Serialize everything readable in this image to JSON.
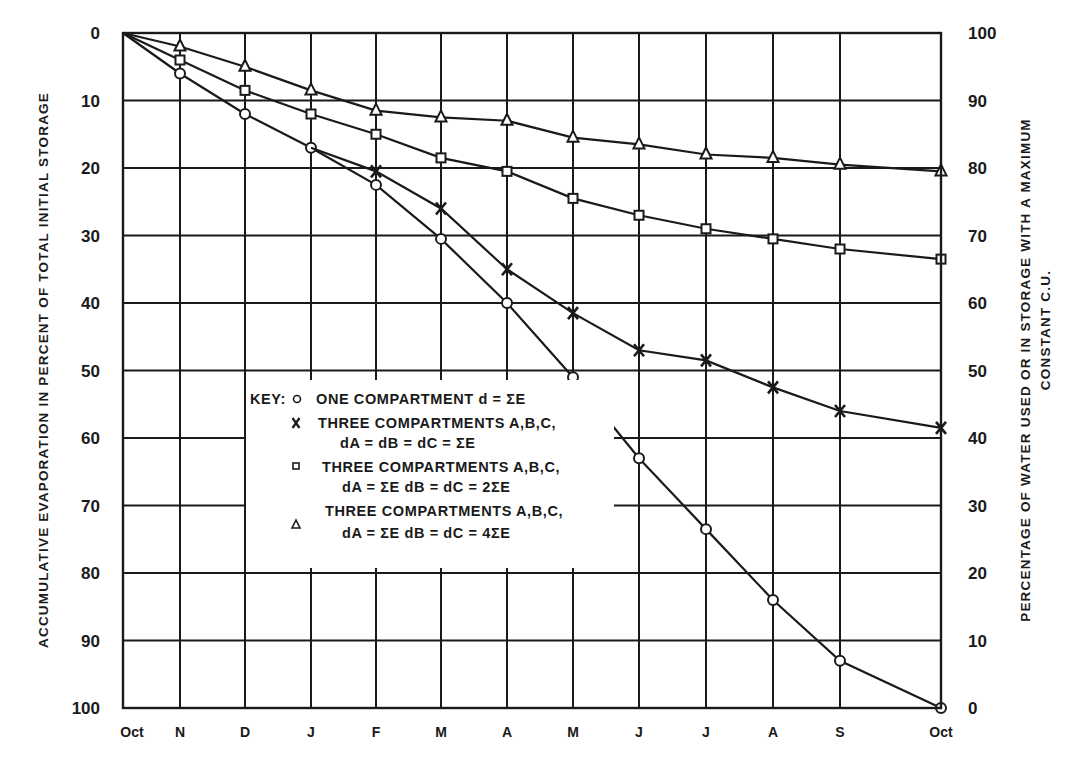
{
  "chart_data": {
    "type": "line",
    "title": "",
    "x": [
      "Oct",
      "N",
      "D",
      "J",
      "F",
      "M",
      "A",
      "M",
      "J",
      "J",
      "A",
      "S",
      "Oct"
    ],
    "xlabel": "",
    "ylabel": "ACCUMULATIVE EVAPORATION IN PERCENT OF TOTAL INITIAL STORAGE",
    "ylabel_right_line1": "PERCENTAGE OF WATER USED OR IN STORAGE WITH A MAXIMUM",
    "ylabel_right_line2": "CONSTANT C.U.",
    "ylim": [
      0,
      100
    ],
    "y_inverted": true,
    "y_ticks_left": [
      "0",
      "10",
      "20",
      "30",
      "40",
      "50",
      "60",
      "70",
      "80",
      "90",
      "100"
    ],
    "y_ticks_right": [
      "100",
      "90",
      "80",
      "70",
      "60",
      "50",
      "40",
      "30",
      "20",
      "10",
      "0"
    ],
    "grid": true,
    "legend_position": "inside-lower-left",
    "legend": {
      "key_label": "KEY:",
      "entries": [
        {
          "marker": "circle",
          "line1": "ONE COMPARTMENT d = ΣE",
          "line2": ""
        },
        {
          "marker": "x",
          "line1": "THREE COMPARTMENTS A,B,C,",
          "line2": "dA = dB = dC = ΣE"
        },
        {
          "marker": "square",
          "line1": "THREE COMPARTMENTS A,B,C,",
          "line2": "dA = ΣE   dB = dC = 2ΣE"
        },
        {
          "marker": "triangle",
          "line1": "THREE COMPARTMENTS A,B,C,",
          "line2": "dA = ΣE   dB = dC = 4ΣE"
        }
      ]
    },
    "series": [
      {
        "name": "One compartment d = ΣE",
        "marker": "circle",
        "values": [
          0,
          6,
          12,
          17,
          22.5,
          30.5,
          40,
          51,
          63,
          73.5,
          84,
          93,
          100
        ]
      },
      {
        "name": "Three compartments A,B,C, dA = dB = dC = ΣE",
        "marker": "x",
        "values": [
          0,
          null,
          null,
          null,
          20.5,
          26,
          35,
          41.5,
          47,
          48.5,
          52.5,
          56,
          58.5
        ]
      },
      {
        "name": "Three compartments A,B,C, dA = ΣE, dB = dC = 2ΣE",
        "marker": "square",
        "values": [
          0,
          4,
          8.5,
          12,
          15,
          18.5,
          20.5,
          24.5,
          27,
          29,
          30.5,
          32,
          33.5
        ]
      },
      {
        "name": "Three compartments A,B,C, dA = ΣE, dB = dC = 4ΣE",
        "marker": "triangle",
        "values": [
          0,
          2,
          5,
          8.5,
          11.5,
          12.5,
          13,
          15.5,
          16.5,
          18,
          18.5,
          19.5,
          20.5
        ]
      }
    ],
    "x_line_connect_note": "X series branches off the circle series between J and F"
  },
  "layout": {
    "plot": {
      "left": 123,
      "top": 33,
      "right": 941,
      "bottom": 708
    },
    "x_positions": [
      123,
      180,
      245,
      311,
      376,
      441,
      507,
      573,
      639,
      706,
      773,
      840,
      941
    ],
    "line_color": "#1a1a1a",
    "grid_color": "#1a1a1a"
  }
}
